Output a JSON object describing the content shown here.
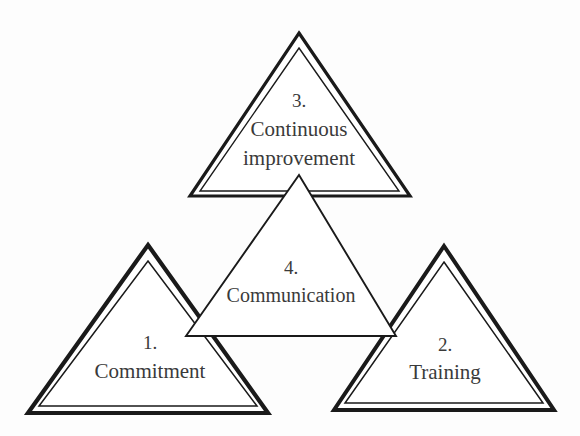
{
  "diagram": {
    "type": "nested-triangles-framework",
    "background_color": "#fdfdfd",
    "line_color": "#1a1a1a",
    "text_color": "#3a3a3a",
    "fill_color": "#ffffff",
    "nodes": [
      {
        "id": "continuous-improvement",
        "number": "3.",
        "line1": "Continuous",
        "line2": "improvement",
        "position": "top",
        "border_style": "double",
        "apex": [
          299,
          33
        ],
        "left": [
          190,
          196
        ],
        "right": [
          410,
          196
        ]
      },
      {
        "id": "commitment",
        "number": "1.",
        "line1": "Commitment",
        "line2": "",
        "position": "bottom-left",
        "border_style": "double",
        "apex": [
          148,
          245
        ],
        "left": [
          28,
          413
        ],
        "right": [
          268,
          413
        ]
      },
      {
        "id": "training",
        "number": "2.",
        "line1": "Training",
        "line2": "",
        "position": "bottom-right",
        "border_style": "double",
        "apex": [
          444,
          246
        ],
        "left": [
          334,
          410
        ],
        "right": [
          554,
          410
        ]
      },
      {
        "id": "communication",
        "number": "4.",
        "line1": "Communication",
        "line2": "",
        "position": "center",
        "border_style": "single",
        "apex": [
          299,
          175
        ],
        "left": [
          186,
          336
        ],
        "right": [
          396,
          336
        ]
      }
    ]
  }
}
